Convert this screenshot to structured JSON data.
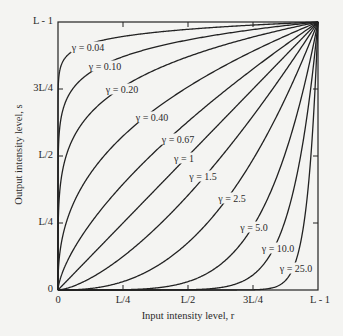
{
  "chart_data": {
    "type": "line",
    "title": "",
    "xlabel": "Input intensity level, r",
    "ylabel": "Output intensity level, s",
    "xlim": [
      0,
      1
    ],
    "ylim": [
      0,
      1
    ],
    "grid": false,
    "formula": "s = r^gamma (normalized to L-1)",
    "x_ticks": [
      {
        "pos": 0,
        "label": "0"
      },
      {
        "pos": 0.25,
        "label": "L/4"
      },
      {
        "pos": 0.5,
        "label": "L/2"
      },
      {
        "pos": 0.75,
        "label": "3L/4"
      },
      {
        "pos": 1,
        "label": "L - 1"
      }
    ],
    "y_ticks": [
      {
        "pos": 0,
        "label": "0"
      },
      {
        "pos": 0.25,
        "label": "L/4"
      },
      {
        "pos": 0.5,
        "label": "L/2"
      },
      {
        "pos": 0.75,
        "label": "3L/4"
      },
      {
        "pos": 1,
        "label": "L - 1"
      }
    ],
    "series": [
      {
        "name": "γ = 0.04",
        "gamma": 0.04,
        "label_pos": [
          88,
          47
        ]
      },
      {
        "name": "γ = 0.10",
        "gamma": 0.1,
        "label_pos": [
          105,
          66
        ]
      },
      {
        "name": "γ = 0.20",
        "gamma": 0.2,
        "label_pos": [
          122,
          89
        ]
      },
      {
        "name": "γ = 0.40",
        "gamma": 0.4,
        "label_pos": [
          152,
          117
        ]
      },
      {
        "name": "γ = 0.67",
        "gamma": 0.67,
        "label_pos": [
          178,
          139
        ]
      },
      {
        "name": "γ = 1",
        "gamma": 1.0,
        "label_pos": [
          184,
          158
        ]
      },
      {
        "name": "γ = 1.5",
        "gamma": 1.5,
        "label_pos": [
          203,
          176
        ]
      },
      {
        "name": "γ = 2.5",
        "gamma": 2.5,
        "label_pos": [
          232,
          198
        ]
      },
      {
        "name": "γ = 5.0",
        "gamma": 5.0,
        "label_pos": [
          254,
          227
        ]
      },
      {
        "name": "γ = 10.0",
        "gamma": 10.0,
        "label_pos": [
          278,
          248
        ]
      },
      {
        "name": "γ = 25.0",
        "gamma": 25.0,
        "label_pos": [
          296,
          268
        ]
      }
    ]
  },
  "plot_box": {
    "left": 58,
    "top": 22,
    "right": 318,
    "bottom": 290
  },
  "colors": {
    "line": "#222222",
    "background": "#f4f4f2"
  }
}
